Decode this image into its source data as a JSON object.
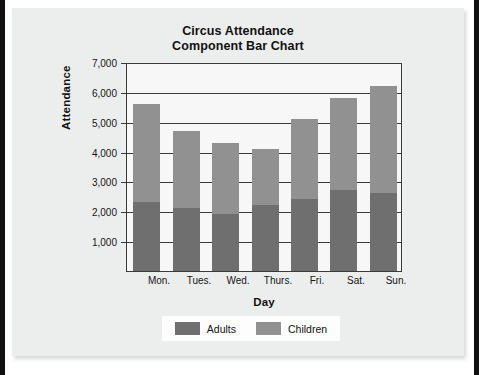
{
  "chart_data": {
    "type": "bar",
    "subtype": "stacked-component-bar",
    "title": "Circus Attendance",
    "subtitle": "Component Bar Chart",
    "xlabel": "Day",
    "ylabel": "Attendance",
    "categories": [
      "Mon.",
      "Tues.",
      "Wed.",
      "Thurs.",
      "Fri.",
      "Sat.",
      "Sun."
    ],
    "series": [
      {
        "name": "Adults",
        "color": "#6f6f6f",
        "values": [
          2300,
          2100,
          1900,
          2200,
          2400,
          2700,
          2600
        ]
      },
      {
        "name": "Children",
        "color": "#919191",
        "values": [
          3300,
          2600,
          2400,
          1900,
          2700,
          3100,
          3600
        ]
      }
    ],
    "totals": [
      5600,
      4700,
      4300,
      4100,
      5100,
      5800,
      6200
    ],
    "ylim": [
      0,
      7000
    ],
    "ytick_labels": [
      "7,000",
      "6,000",
      "5,000",
      "4,000",
      "3,000",
      "2,000",
      "1,000"
    ],
    "ytick_values": [
      7000,
      6000,
      5000,
      4000,
      3000,
      2000,
      1000
    ],
    "grid": true,
    "legend_position": "bottom",
    "legend_entries": [
      "Adults",
      "Children"
    ]
  },
  "colors": {
    "card_background": "#eceded",
    "plot_background": "#f7f7f7",
    "axis": "#3a3a3a",
    "adults": "#6f6f6f",
    "children": "#919191",
    "text": "#121212"
  }
}
